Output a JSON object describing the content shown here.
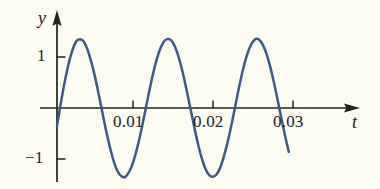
{
  "figure": {
    "background_color": "#fdfcf2",
    "curve_color": "#3d5a82",
    "axis_color": "#23231f",
    "x_axis_label": "t",
    "y_axis_label": "y"
  },
  "axes": {
    "x_ticks": [
      {
        "label": "0.01",
        "value": 0.01
      },
      {
        "label": "0.02",
        "value": 0.02
      },
      {
        "label": "0.03",
        "value": 0.03
      }
    ],
    "y_ticks": [
      {
        "label": "1",
        "value": 1
      },
      {
        "label": "−1",
        "value": -1
      }
    ]
  },
  "chart_data": {
    "type": "line",
    "title": "",
    "xlabel": "t",
    "ylabel": "y",
    "xlim": [
      0,
      0.0335
    ],
    "ylim": [
      -1.5,
      1.5
    ],
    "grid": false,
    "legend": null,
    "amplitude": 1.35,
    "period": 0.0166,
    "phase_shift": -0.0007,
    "series": [
      {
        "name": "y(t)",
        "x": [
          0.0,
          0.0005,
          0.001,
          0.0015,
          0.002,
          0.0025,
          0.003,
          0.0035,
          0.004,
          0.0045,
          0.005,
          0.0055,
          0.006,
          0.0065,
          0.007,
          0.0075,
          0.008,
          0.0085,
          0.009,
          0.0095,
          0.01,
          0.0105,
          0.011,
          0.0115,
          0.012,
          0.0125,
          0.013,
          0.0135,
          0.014,
          0.0145,
          0.015,
          0.0155,
          0.016,
          0.0165,
          0.017,
          0.0175,
          0.018,
          0.0185,
          0.019,
          0.0195,
          0.02,
          0.0205,
          0.021,
          0.0215,
          0.022,
          0.0225,
          0.023,
          0.0235,
          0.024,
          0.0245,
          0.025,
          0.0255,
          0.026,
          0.0265,
          0.027,
          0.0275,
          0.028,
          0.0285,
          0.029,
          0.0295,
          0.03,
          0.0305
        ],
        "y": [
          -0.35,
          0.09,
          0.5,
          0.85,
          1.12,
          1.3,
          1.35,
          1.31,
          1.15,
          0.91,
          0.61,
          0.26,
          -0.11,
          -0.47,
          -0.79,
          -1.06,
          -1.25,
          -1.34,
          -1.35,
          -1.25,
          -1.07,
          -0.81,
          -0.5,
          -0.14,
          0.23,
          0.58,
          0.89,
          1.13,
          1.29,
          1.35,
          1.33,
          1.21,
          1.0,
          0.72,
          0.39,
          0.03,
          -0.33,
          -0.67,
          -0.96,
          -1.18,
          -1.31,
          -1.35,
          -1.3,
          -1.16,
          -0.93,
          -0.64,
          -0.3,
          0.07,
          0.44,
          0.77,
          1.04,
          1.23,
          1.34,
          1.35,
          1.26,
          1.09,
          0.84,
          0.53,
          0.18,
          -0.19,
          -0.54,
          -0.86
        ]
      }
    ]
  }
}
